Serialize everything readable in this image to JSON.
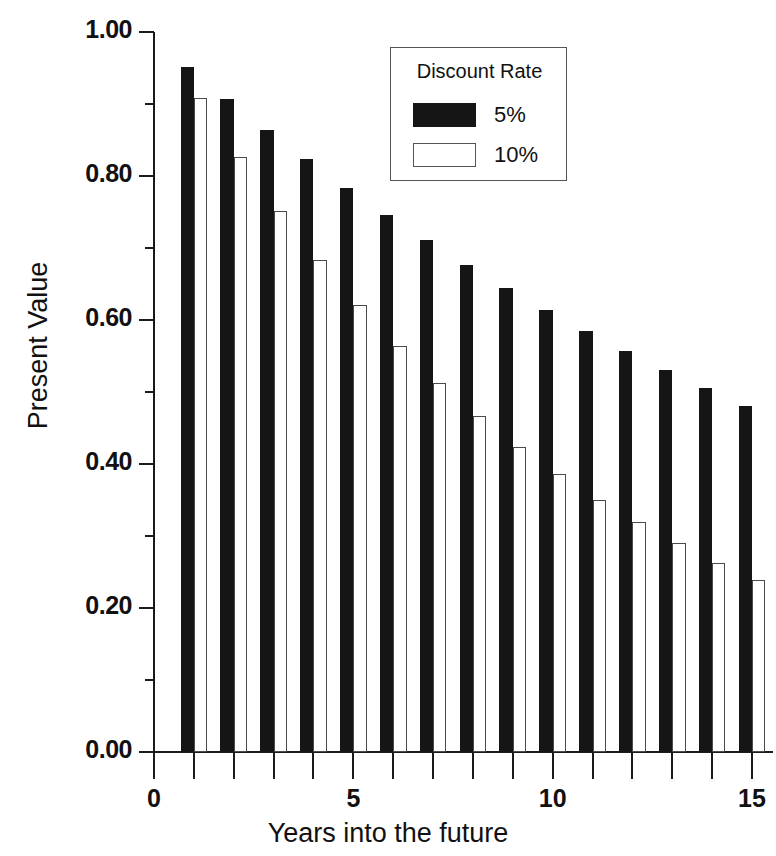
{
  "chart_data": {
    "type": "bar",
    "title": "",
    "xlabel": "Years into the future",
    "ylabel": "Present Value",
    "x": [
      1,
      2,
      3,
      4,
      5,
      6,
      7,
      8,
      9,
      10,
      11,
      12,
      13,
      14,
      15
    ],
    "categories": [
      "1",
      "2",
      "3",
      "4",
      "5",
      "6",
      "7",
      "8",
      "9",
      "10",
      "11",
      "12",
      "13",
      "14",
      "15"
    ],
    "series": [
      {
        "name": "5%",
        "color": "#151515",
        "values": [
          0.952,
          0.907,
          0.864,
          0.823,
          0.784,
          0.746,
          0.711,
          0.677,
          0.645,
          0.614,
          0.585,
          0.557,
          0.53,
          0.505,
          0.481
        ]
      },
      {
        "name": "10%",
        "color": "#ffffff",
        "values": [
          0.909,
          0.826,
          0.751,
          0.683,
          0.621,
          0.564,
          0.513,
          0.467,
          0.424,
          0.386,
          0.35,
          0.319,
          0.29,
          0.263,
          0.239
        ]
      }
    ],
    "xlim": [
      0,
      15
    ],
    "ylim": [
      0.0,
      1.0
    ],
    "x_ticks": [
      0,
      5,
      10,
      15
    ],
    "x_tick_labels": [
      "0",
      "5",
      "10",
      "15"
    ],
    "x_minor_ticks": [
      1,
      2,
      3,
      4,
      6,
      7,
      8,
      9,
      11,
      12,
      13,
      14
    ],
    "y_ticks": [
      0.0,
      0.2,
      0.4,
      0.6,
      0.8,
      1.0
    ],
    "y_tick_labels": [
      "0.00",
      "0.20",
      "0.40",
      "0.60",
      "0.80",
      "1.00"
    ],
    "y_minor_ticks": [
      0.1,
      0.3,
      0.5,
      0.7,
      0.9
    ],
    "grid": false,
    "legend_position": "top-center"
  },
  "legend": {
    "title": "Discount Rate",
    "entries": [
      {
        "label": "5%",
        "swatch": "filled-black"
      },
      {
        "label": "10%",
        "swatch": "outlined-white"
      }
    ]
  },
  "axes": {
    "x_title": "Years into the future",
    "y_title": "Present Value"
  }
}
